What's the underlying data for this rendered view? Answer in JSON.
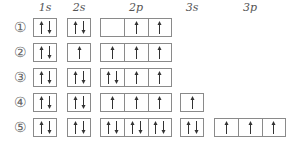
{
  "headers": [
    {
      "label": "1s",
      "x": 45
    },
    {
      "label": "2s",
      "x": 79
    },
    {
      "label": "2p",
      "x": 136
    },
    {
      "label": "3s",
      "x": 192
    },
    {
      "label": "3p",
      "x": 250
    }
  ],
  "subshells": [
    {
      "name": "1s",
      "x": 33,
      "cells": 1
    },
    {
      "name": "2s",
      "x": 67,
      "cells": 1
    },
    {
      "name": "2p",
      "x": 100,
      "cells": 3
    },
    {
      "name": "3s",
      "x": 180,
      "cells": 1
    },
    {
      "name": "3p",
      "x": 214,
      "cells": 3
    }
  ],
  "options": [
    {
      "label": "①",
      "top": 18,
      "orbitals": {
        "1s": [
          "ud"
        ],
        "2s": [
          "ud"
        ],
        "2p": [
          "",
          "u",
          "u"
        ]
      }
    },
    {
      "label": "②",
      "top": 43,
      "orbitals": {
        "1s": [
          "ud"
        ],
        "2s": [
          "u"
        ],
        "2p": [
          "u",
          "u",
          "u"
        ]
      }
    },
    {
      "label": "③",
      "top": 68,
      "orbitals": {
        "1s": [
          "ud"
        ],
        "2s": [
          "ud"
        ],
        "2p": [
          "ud",
          "u",
          "u"
        ]
      }
    },
    {
      "label": "④",
      "top": 93,
      "orbitals": {
        "1s": [
          "ud"
        ],
        "2s": [
          "ud"
        ],
        "2p": [
          "u",
          "u",
          "u"
        ],
        "3s": [
          "u"
        ]
      }
    },
    {
      "label": "⑤",
      "top": 118,
      "orbitals": {
        "1s": [
          "ud"
        ],
        "2s": [
          "ud"
        ],
        "2p": [
          "ud",
          "ud",
          "ud"
        ],
        "3s": [
          "ud"
        ],
        "3p": [
          "u",
          "u",
          "u"
        ]
      }
    }
  ],
  "colors": {
    "border": "#8a8a8a",
    "arrow": "#333333",
    "text": "#555555"
  }
}
